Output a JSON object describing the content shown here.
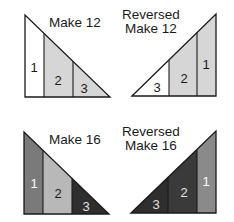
{
  "diagrams": [
    {
      "id": "make-12",
      "title_lines": [
        "Make 12"
      ],
      "orientation": "left",
      "pieces": [
        {
          "number": "1",
          "fill": "#ffffff",
          "text_color": "#1a1a1a"
        },
        {
          "number": "2",
          "fill": "#d6d6d6",
          "text_color": "#1a1a1a"
        },
        {
          "number": "3",
          "fill": "#d6d6d6",
          "text_color": "#1a1a1a"
        }
      ]
    },
    {
      "id": "reversed-make-12",
      "title_lines": [
        "Reversed",
        "Make 12"
      ],
      "orientation": "right",
      "pieces": [
        {
          "number": "3",
          "fill": "#ffffff",
          "text_color": "#1a1a1a"
        },
        {
          "number": "2",
          "fill": "#d6d6d6",
          "text_color": "#1a1a1a"
        },
        {
          "number": "1",
          "fill": "#d6d6d6",
          "text_color": "#1a1a1a"
        }
      ]
    },
    {
      "id": "make-16",
      "title_lines": [
        "Make 16"
      ],
      "orientation": "left",
      "pieces": [
        {
          "number": "1",
          "fill": "#7a7a7a",
          "text_color": "#ffffff"
        },
        {
          "number": "2",
          "fill": "#b8b8b8",
          "text_color": "#1a1a1a"
        },
        {
          "number": "3",
          "fill": "#2e2e2e",
          "text_color": "#e0e0e0"
        }
      ]
    },
    {
      "id": "reversed-make-16",
      "title_lines": [
        "Reversed",
        "Make 16"
      ],
      "orientation": "right",
      "pieces": [
        {
          "number": "3",
          "fill": "#2e2e2e",
          "text_color": "#e0e0e0"
        },
        {
          "number": "2",
          "fill": "#3a3a3a",
          "text_color": "#e0e0e0"
        },
        {
          "number": "1",
          "fill": "#8a8a8a",
          "text_color": "#ffffff"
        }
      ]
    }
  ],
  "stroke_color": "#1a1a1a"
}
